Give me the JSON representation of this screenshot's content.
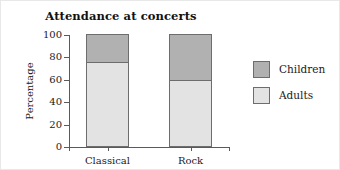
{
  "chart_data": {
    "type": "bar",
    "subtype": "stacked-bar",
    "title": "Attendance at concerts",
    "xlabel": "",
    "ylabel": "Percentage",
    "categories": [
      "Classical",
      "Rock"
    ],
    "series": [
      {
        "name": "Adults",
        "values": [
          75,
          59
        ],
        "color": "#e3e3e3"
      },
      {
        "name": "Children",
        "values": [
          25,
          41
        ],
        "color": "#b1b1b1"
      }
    ],
    "stack_order": [
      "Adults",
      "Children"
    ],
    "ylim": [
      0,
      100
    ],
    "yticks": [
      0,
      20,
      40,
      60,
      80,
      100
    ],
    "ytick_labels": [
      "0",
      "20",
      "40",
      "60",
      "80",
      "100"
    ],
    "grid": false,
    "legend_position": "right",
    "legend_entries": [
      {
        "label": "Children",
        "color": "#b1b1b1"
      },
      {
        "label": "Adults",
        "color": "#e3e3e3"
      }
    ],
    "axis_color": "#5a5a5a",
    "bar_outline_color": "#6d6d6d",
    "background": "#ffffff"
  }
}
